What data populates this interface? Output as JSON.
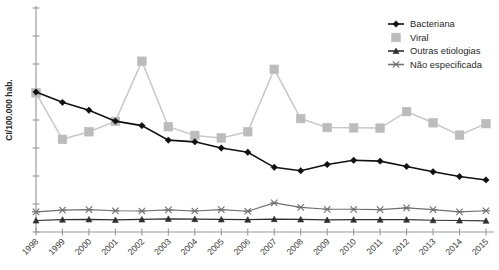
{
  "chart_data": {
    "type": "line",
    "title": "",
    "xlabel": "",
    "ylabel": "CI/100.000 hab.",
    "grid": false,
    "legend_position": "top-right",
    "categories": [
      "1998",
      "1999",
      "2000",
      "2001",
      "2002",
      "2003",
      "2004",
      "2005",
      "2006",
      "2007",
      "2008",
      "2009",
      "2010",
      "2011",
      "2012",
      "2013",
      "2014",
      "2015"
    ],
    "ylim": [
      0,
      8
    ],
    "yticks": [
      0,
      1,
      2,
      3,
      4,
      5,
      6,
      7
    ],
    "ytick_labels": [
      "",
      "",
      "",
      "",
      "",
      "",
      "",
      ""
    ],
    "series": [
      {
        "name": "Bacteriana",
        "color": "#111111",
        "marker": "diamond",
        "values": [
          5.0,
          4.63,
          4.35,
          3.96,
          3.8,
          3.28,
          3.22,
          3.0,
          2.85,
          2.31,
          2.19,
          2.41,
          2.56,
          2.53,
          2.34,
          2.15,
          1.98,
          1.86
        ]
      },
      {
        "name": "Viral",
        "color": "#bcbcbc",
        "marker": "square",
        "values": [
          4.97,
          3.31,
          3.58,
          3.95,
          6.1,
          3.76,
          3.45,
          3.36,
          3.58,
          5.81,
          4.05,
          3.73,
          3.72,
          3.71,
          4.3,
          3.9,
          3.46,
          3.87
        ]
      },
      {
        "name": "Outras etiologias",
        "color": "#2f2f2f",
        "marker": "triangle",
        "values": [
          0.41,
          0.44,
          0.45,
          0.43,
          0.45,
          0.47,
          0.46,
          0.45,
          0.44,
          0.46,
          0.45,
          0.43,
          0.44,
          0.44,
          0.44,
          0.42,
          0.41,
          0.4
        ]
      },
      {
        "name": "Não especificada",
        "color": "#6f6f6f",
        "marker": "x",
        "values": [
          0.72,
          0.78,
          0.8,
          0.76,
          0.75,
          0.79,
          0.75,
          0.8,
          0.74,
          1.04,
          0.88,
          0.81,
          0.81,
          0.8,
          0.86,
          0.8,
          0.72,
          0.76
        ]
      }
    ]
  },
  "legend": {
    "items": [
      {
        "label": "Bacteriana"
      },
      {
        "label": "Viral"
      },
      {
        "label": "Outras etiologias"
      },
      {
        "label": "Não especificada"
      }
    ]
  }
}
